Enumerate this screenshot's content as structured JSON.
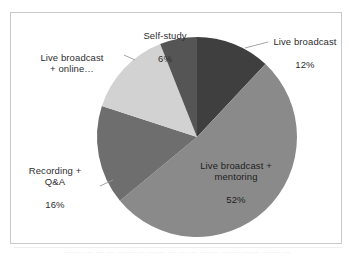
{
  "chart_data": {
    "type": "pie",
    "title": "",
    "categories": [
      "Live broadcast",
      "Live broadcast + mentoring",
      "Recording + Q&A",
      "Live broadcast + online…",
      "Self-study"
    ],
    "values": [
      12,
      52,
      16,
      14,
      6
    ],
    "value_suffix": "%",
    "colors": [
      "#3f3f3f",
      "#8a8a8a",
      "#6e6e6e",
      "#d2d2d2",
      "#555555"
    ],
    "legend": "none",
    "grid": false,
    "start_angle_deg": 0,
    "direction": "clockwise"
  },
  "labels": {
    "self_study": {
      "name": "Self-study",
      "value": "6%"
    },
    "live_broadcast": {
      "name": "Live broadcast",
      "value": "12%"
    },
    "live_broadcast_online": {
      "name": "Live broadcast\n+ online…",
      "value": ""
    },
    "recording_qa": {
      "name": "Recording +\nQ&A",
      "value": "16%"
    },
    "live_broadcast_mentoring": {
      "name": "Live broadcast +\nmentoring",
      "value": "52%"
    }
  },
  "artifacts": {
    "top_bleed": "— —— ———— ——— ————— —— ———— ——— ——",
    "bottom_bleed": "——— —— ————— ——— —— ———— ———"
  }
}
